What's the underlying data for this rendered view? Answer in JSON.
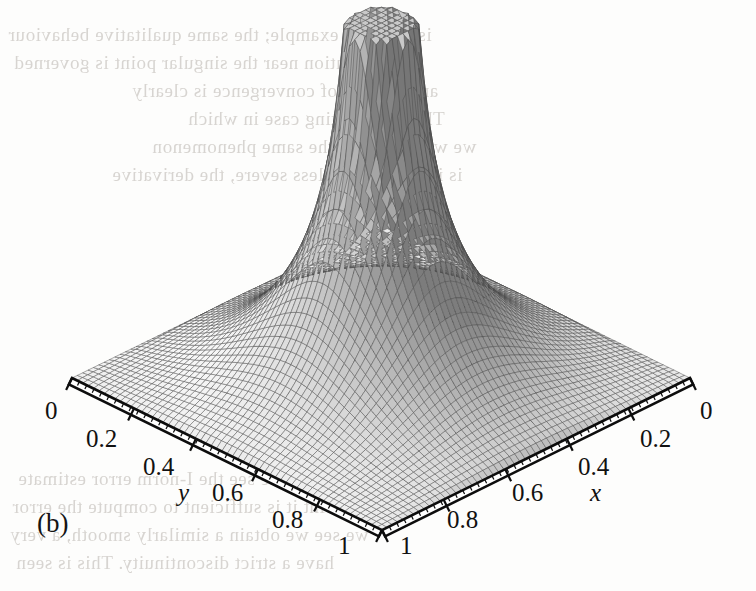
{
  "figure": {
    "caption": "(b)",
    "type": "3d-surface-mesh",
    "background_color": "#fdfdfc",
    "mesh_color": "#4a4a4a"
  },
  "axes": {
    "x": {
      "name": "x",
      "ticks": [
        "0",
        "0.2",
        "0.4",
        "0.6",
        "0.8",
        "1"
      ],
      "tick_values": [
        0,
        0.2,
        0.4,
        0.6,
        0.8,
        1
      ],
      "range": [
        0,
        1
      ],
      "direction": "right-edge, decreasing to the right-rear corner"
    },
    "y": {
      "name": "y",
      "ticks": [
        "0",
        "0.2",
        "0.4",
        "0.6",
        "0.8",
        "1"
      ],
      "tick_values": [
        0,
        0.2,
        0.4,
        0.6,
        0.8,
        1
      ],
      "range": [
        0,
        1
      ],
      "direction": "left-edge, increasing toward the front corner"
    },
    "z": {
      "name": "",
      "ticks": [],
      "range": [
        0,
        1
      ]
    }
  },
  "chart_data": {
    "type": "surface",
    "title": "",
    "subtitle": "",
    "xlabel": "x",
    "ylabel": "y",
    "zlabel": "",
    "xlim": [
      0,
      1
    ],
    "ylim": [
      0,
      1
    ],
    "zlim": [
      0,
      1
    ],
    "grid": true,
    "legend": "none",
    "annotations": [
      "(b)"
    ],
    "x_ticks": [
      0,
      0.2,
      0.4,
      0.6,
      0.8,
      1
    ],
    "y_ticks": [
      0,
      0.2,
      0.4,
      0.6,
      0.8,
      1
    ],
    "x_tick_labels": [
      "0",
      "0.2",
      "0.4",
      "0.6",
      "0.8",
      "1"
    ],
    "y_tick_labels": [
      "0",
      "0.2",
      "0.4",
      "0.6",
      "0.8",
      "1"
    ],
    "mesh_n": 64,
    "peak": {
      "x": 0.5,
      "y": 0.5,
      "z_clipped_at": 1.0,
      "flat_top": true
    },
    "corner_values": [
      {
        "x": 0,
        "y": 0,
        "z": 0.0
      },
      {
        "x": 1,
        "y": 0,
        "z": 0.0
      },
      {
        "x": 0,
        "y": 1,
        "z": 0.0
      },
      {
        "x": 1,
        "y": 1,
        "z": 0.0
      }
    ],
    "profile_along_diagonal": {
      "t": [
        0.0,
        0.1,
        0.2,
        0.3,
        0.4,
        0.45,
        0.5,
        0.55,
        0.6,
        0.7,
        0.8,
        0.9,
        1.0
      ],
      "z": [
        0.0,
        0.04,
        0.1,
        0.19,
        0.42,
        0.78,
        1.0,
        0.78,
        0.42,
        0.19,
        0.1,
        0.04,
        0.0
      ]
    },
    "edge_profile_y0": {
      "x": [
        0.0,
        0.1,
        0.2,
        0.3,
        0.4,
        0.5,
        0.6,
        0.7,
        0.8,
        0.9,
        1.0
      ],
      "z": [
        0.0,
        0.1,
        0.21,
        0.3,
        0.35,
        0.37,
        0.35,
        0.3,
        0.21,
        0.1,
        0.0
      ]
    },
    "note": "Values are normalised heights read off the rendered surface; the central spike is truncated at the top of the z-range."
  },
  "bleed_text": {
    "note": "faint mirrored show-through of printed text from the reverse side of the page",
    "lines": [
      {
        "text": "is a simple example; the same qualitative behaviour",
        "x": 8,
        "y": 24,
        "size": 19
      },
      {
        "text": "the solution near the singular point is governed",
        "x": 14,
        "y": 52,
        "size": 19
      },
      {
        "text": "and the rate of convergence is clearly",
        "x": 132,
        "y": 80,
        "size": 19
      },
      {
        "text": "This is a limiting case in which",
        "x": 188,
        "y": 108,
        "size": 19
      },
      {
        "text": "we would expect the same phenomenon",
        "x": 152,
        "y": 136,
        "size": 19
      },
      {
        "text": "is in practice far less severe, the derivative",
        "x": 112,
        "y": 164,
        "size": 19
      },
      {
        "text": "we see the I-norm error estimate",
        "x": 18,
        "y": 468,
        "size": 19
      },
      {
        "text": "a point it is sufficient to compute the error",
        "x": 12,
        "y": 496,
        "size": 19
      },
      {
        "text": "we see we obtain a similarly smooth, a very",
        "x": 10,
        "y": 524,
        "size": 19
      },
      {
        "text": "have a strict discontinuity. This is seen",
        "x": 16,
        "y": 552,
        "size": 19
      }
    ]
  },
  "tick_labels_positions": {
    "y_axis": [
      {
        "label": "0",
        "x": 45,
        "y": 397
      },
      {
        "label": "0.2",
        "x": 86,
        "y": 425
      },
      {
        "label": "0.4",
        "x": 143,
        "y": 453
      },
      {
        "label": "0.6",
        "x": 212,
        "y": 479
      },
      {
        "label": "0.8",
        "x": 272,
        "y": 506
      },
      {
        "label": "1",
        "x": 338,
        "y": 532
      }
    ],
    "x_axis": [
      {
        "label": "0",
        "x": 700,
        "y": 397
      },
      {
        "label": "0.2",
        "x": 640,
        "y": 425
      },
      {
        "label": "0.4",
        "x": 578,
        "y": 453
      },
      {
        "label": "0.6",
        "x": 512,
        "y": 479
      },
      {
        "label": "0.8",
        "x": 447,
        "y": 506
      },
      {
        "label": "1",
        "x": 400,
        "y": 532
      }
    ],
    "axis_names": [
      {
        "label": "y",
        "x": 178,
        "y": 479
      },
      {
        "label": "x",
        "x": 590,
        "y": 479
      }
    ],
    "caption_position": {
      "label": "(b)",
      "x": 37,
      "y": 508
    }
  }
}
